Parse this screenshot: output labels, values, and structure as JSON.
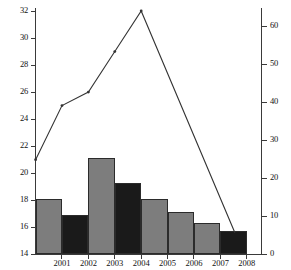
{
  "chart_data": {
    "type": "bar",
    "title": "",
    "xlabel": "",
    "ylabel": "",
    "categories": [
      "2001",
      "2002",
      "2003",
      "2004",
      "2005",
      "2006",
      "2007",
      "2008"
    ],
    "grid": false,
    "legend": "none",
    "left_axis": {
      "ylim": [
        14,
        32
      ],
      "ticks": [
        14,
        16,
        18,
        20,
        22,
        24,
        26,
        28,
        30,
        32
      ],
      "tick_labels": [
        "14",
        "16",
        "18",
        "20",
        "22",
        "24",
        "26",
        "28",
        "30",
        "32"
      ]
    },
    "right_axis": {
      "ylim": [
        0,
        64
      ],
      "ticks": [
        0,
        10,
        20,
        30,
        40,
        50,
        60
      ],
      "tick_labels": [
        "0",
        "10",
        "20",
        "30",
        "40",
        "50",
        "60"
      ]
    },
    "series": [
      {
        "name": "bars",
        "type": "bar",
        "axis": "left",
        "values": [
          18.1,
          16.9,
          21.1,
          19.3,
          18.1,
          17.1,
          16.3,
          15.7
        ],
        "colors": [
          "#7d7d7d",
          "#1a1a1a",
          "#7d7d7d",
          "#1a1a1a",
          "#7d7d7d",
          "#7d7d7d",
          "#7d7d7d",
          "#1a1a1a"
        ]
      },
      {
        "name": "line",
        "type": "line",
        "axis": "left",
        "x": [
          "2000",
          "2001",
          "2002",
          "2003",
          "2004",
          "2008"
        ],
        "values": [
          21.0,
          25.0,
          26.0,
          29.0,
          32.0,
          15.6
        ],
        "color": "#333333",
        "marker": "dot"
      }
    ]
  },
  "colors": {
    "bar_gray": "#7d7d7d",
    "bar_black": "#1a1a1a",
    "axis": "#3a3a3a",
    "line": "#333333",
    "background": "#ffffff"
  }
}
